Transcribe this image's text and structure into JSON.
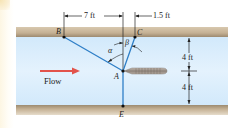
{
  "diagram": {
    "type": "statics-cable-system",
    "flow_label": "Flow",
    "points": {
      "A": "A",
      "B": "B",
      "C": "C",
      "E": "E"
    },
    "angles": {
      "alpha": "α",
      "beta": "β"
    },
    "dimensions": {
      "horizontal_BA": "7 ft",
      "horizontal_AC": "1.5 ft",
      "vertical_upper": "4 ft",
      "vertical_lower": "4 ft"
    },
    "colors": {
      "water": "#dcefff",
      "wall": "#c9b69a",
      "wall_dark": "#a8957a",
      "cable": "#2f7fc7",
      "flow_arrow": "#e2534b",
      "probe": "#8a7f77"
    }
  }
}
